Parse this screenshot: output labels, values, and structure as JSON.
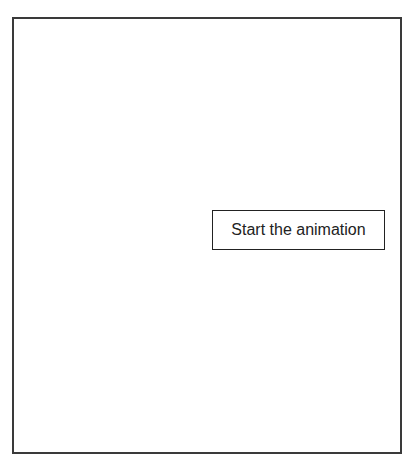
{
  "canvas": {
    "border_color": "#3a3a3a",
    "background": "#ffffff"
  },
  "controls": {
    "start_button_label": "Start the animation"
  }
}
